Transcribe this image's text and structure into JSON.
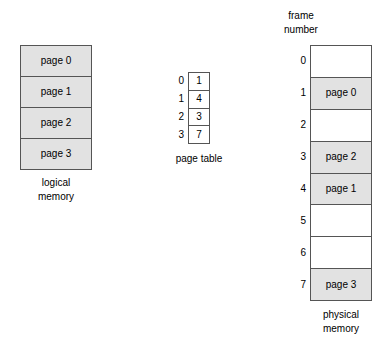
{
  "figure": {
    "background_color": "#ffffff",
    "line_color": "#555555",
    "filled_cell_color": "#e2e2e2",
    "empty_cell_color": "#ffffff"
  },
  "logical_memory": {
    "caption": "logical\nmemory",
    "cells": [
      {
        "label": "page 0",
        "filled": true
      },
      {
        "label": "page 1",
        "filled": true
      },
      {
        "label": "page 2",
        "filled": true
      },
      {
        "label": "page 3",
        "filled": true
      }
    ]
  },
  "page_table": {
    "caption": "page table",
    "entries": [
      {
        "index": "0",
        "value": "1"
      },
      {
        "index": "1",
        "value": "4"
      },
      {
        "index": "2",
        "value": "3"
      },
      {
        "index": "3",
        "value": "7"
      }
    ]
  },
  "physical_memory": {
    "header": "frame\nnumber",
    "caption": "physical\nmemory",
    "frames": [
      {
        "index": "0",
        "label": "",
        "filled": false
      },
      {
        "index": "1",
        "label": "page 0",
        "filled": true
      },
      {
        "index": "2",
        "label": "",
        "filled": false
      },
      {
        "index": "3",
        "label": "page 2",
        "filled": true
      },
      {
        "index": "4",
        "label": "page 1",
        "filled": true
      },
      {
        "index": "5",
        "label": "",
        "filled": false
      },
      {
        "index": "6",
        "label": "",
        "filled": false
      },
      {
        "index": "7",
        "label": "page 3",
        "filled": true
      }
    ]
  }
}
